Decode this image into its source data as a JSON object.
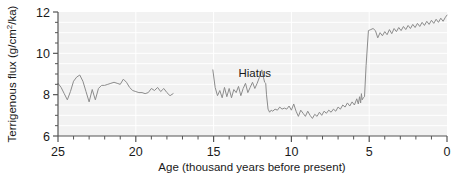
{
  "figure": {
    "name": "terrigenous-flux-timeseries",
    "background_color": "#ffffff",
    "plot_background_color": "#f2f2f2",
    "gridline_color": "#ffffff",
    "axis_color": "#555555",
    "line_color": "#8c8c8c"
  },
  "chart_data": {
    "type": "line",
    "title": "",
    "subtitle": "",
    "xlabel": "Age (thousand years before present)",
    "ylabel": "Terrigenous flux (g/cm²/ka)",
    "ylabel_parts": {
      "pre": "Terrigenous flux (g/cm",
      "sup": "2",
      "post": "/ka)"
    },
    "xlim": [
      25,
      0
    ],
    "ylim": [
      6,
      12
    ],
    "x_inverted": true,
    "xticks": [
      25,
      20,
      15,
      10,
      5,
      0
    ],
    "xtick_labels": [
      "25",
      "20",
      "15",
      "10",
      "5",
      "0"
    ],
    "x_minor_tick_step": 1,
    "yticks": [
      6,
      8,
      10,
      12
    ],
    "ytick_labels": [
      "6",
      "8",
      "10",
      "12"
    ],
    "y_minor_tick_step": 0.5,
    "grid": true,
    "grid_color": "#ffffff",
    "legend": false,
    "legend_position": "none",
    "annotations": [
      {
        "text": "Hiatus",
        "x": 13.4,
        "y": 8.85,
        "name": "hiatus-label"
      }
    ],
    "gap_ranges": [
      [
        17.5,
        15.1
      ]
    ],
    "series": [
      {
        "name": "Terrigenous flux",
        "color": "#8c8c8c",
        "linewidth": 1,
        "x": [
          25.0,
          24.8,
          24.6,
          24.4,
          24.2,
          24.0,
          23.8,
          23.6,
          23.4,
          23.2,
          23.0,
          22.8,
          22.6,
          22.4,
          22.2,
          22.0,
          21.8,
          21.6,
          21.4,
          21.2,
          21.0,
          20.8,
          20.6,
          20.4,
          20.2,
          20.0,
          19.8,
          19.6,
          19.4,
          19.2,
          19.0,
          18.8,
          18.6,
          18.4,
          18.2,
          18.0,
          17.8,
          17.6,
          15.05,
          14.9,
          14.75,
          14.6,
          14.45,
          14.3,
          14.15,
          14.0,
          13.85,
          13.7,
          13.55,
          13.4,
          13.25,
          13.1,
          12.95,
          12.8,
          12.65,
          12.5,
          12.35,
          12.2,
          12.05,
          11.9,
          11.8,
          11.72,
          11.65,
          11.6,
          11.5,
          11.4,
          11.3,
          11.2,
          11.05,
          10.9,
          10.75,
          10.6,
          10.45,
          10.3,
          10.15,
          10.0,
          9.85,
          9.7,
          9.55,
          9.4,
          9.25,
          9.1,
          8.95,
          8.8,
          8.65,
          8.5,
          8.35,
          8.2,
          8.05,
          7.9,
          7.75,
          7.6,
          7.45,
          7.3,
          7.15,
          7.0,
          6.85,
          6.7,
          6.55,
          6.4,
          6.25,
          6.1,
          5.95,
          5.8,
          5.7,
          5.62,
          5.55,
          5.5,
          5.45,
          5.38,
          5.3,
          5.2,
          5.05,
          4.9,
          4.75,
          4.6,
          4.45,
          4.3,
          4.15,
          4.0,
          3.85,
          3.7,
          3.55,
          3.4,
          3.25,
          3.1,
          2.95,
          2.8,
          2.65,
          2.5,
          2.35,
          2.2,
          2.05,
          1.9,
          1.75,
          1.6,
          1.45,
          1.3,
          1.15,
          1.0,
          0.85,
          0.7,
          0.55,
          0.4,
          0.25,
          0.1,
          0.0
        ],
        "y": [
          8.55,
          8.35,
          8.05,
          7.75,
          8.15,
          8.65,
          8.85,
          8.95,
          8.65,
          8.15,
          7.65,
          8.25,
          7.75,
          8.3,
          8.45,
          8.45,
          8.5,
          8.55,
          8.6,
          8.55,
          8.5,
          8.75,
          8.6,
          8.35,
          8.2,
          8.15,
          8.1,
          8.1,
          8.05,
          8.1,
          8.3,
          8.2,
          8.35,
          8.15,
          8.3,
          8.1,
          7.95,
          8.05,
          9.2,
          8.35,
          7.95,
          8.2,
          7.85,
          8.35,
          7.9,
          8.3,
          7.85,
          8.25,
          8.1,
          8.4,
          7.95,
          8.3,
          8.55,
          8.1,
          8.35,
          8.6,
          8.3,
          8.55,
          8.85,
          9.2,
          8.85,
          8.6,
          8.55,
          8.0,
          7.3,
          7.15,
          7.25,
          7.2,
          7.3,
          7.25,
          7.4,
          7.3,
          7.35,
          7.3,
          7.45,
          7.25,
          7.55,
          7.2,
          6.95,
          7.25,
          7.1,
          6.95,
          7.2,
          7.0,
          6.85,
          7.05,
          6.95,
          7.15,
          7.0,
          7.2,
          7.1,
          7.25,
          7.15,
          7.3,
          7.2,
          7.4,
          7.3,
          7.5,
          7.4,
          7.6,
          7.45,
          7.65,
          7.5,
          7.8,
          7.55,
          7.9,
          7.6,
          8.05,
          7.75,
          7.85,
          7.9,
          9.4,
          11.1,
          11.15,
          11.2,
          11.1,
          10.75,
          11.0,
          10.85,
          11.05,
          10.9,
          11.15,
          10.95,
          11.2,
          11.05,
          11.25,
          11.1,
          11.3,
          11.15,
          11.35,
          11.2,
          11.4,
          11.25,
          11.45,
          11.3,
          11.5,
          11.35,
          11.55,
          11.4,
          11.6,
          11.45,
          11.65,
          11.5,
          11.7,
          11.55,
          11.75,
          11.85
        ]
      }
    ]
  }
}
